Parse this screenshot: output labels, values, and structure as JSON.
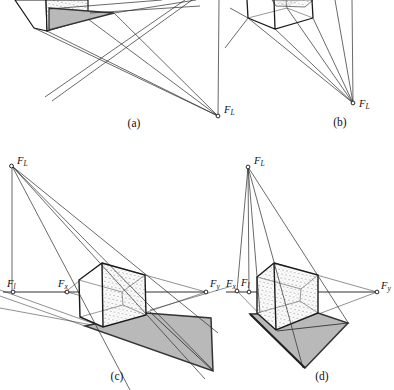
{
  "figure_title": "Perspective shadow construction of a cube (four panels)",
  "labels": {
    "F": "F",
    "sub_L": "L",
    "sub_l": "l",
    "sub_x": "x",
    "sub_y": "y"
  },
  "captions": {
    "a": "(a)",
    "b": "(b)",
    "c": "(c)",
    "d": "(d)"
  },
  "panels": [
    {
      "id": "a",
      "caption": "(a)",
      "points": [
        "F_L"
      ]
    },
    {
      "id": "b",
      "caption": "(b)",
      "points": [
        "F_L"
      ]
    },
    {
      "id": "c",
      "caption": "(c)",
      "points": [
        "F_L",
        "F_l",
        "F_x",
        "F_y"
      ]
    },
    {
      "id": "d",
      "caption": "(d)",
      "points": [
        "F_L",
        "F_x",
        "F_l",
        "F_y"
      ]
    }
  ],
  "colors": {
    "line": "#1a1a1a",
    "shadow_fill": "#b9b9b9",
    "background": "#ffffff"
  }
}
